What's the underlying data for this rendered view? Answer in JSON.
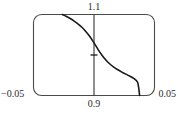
{
  "figure": {
    "background_color": "#ffffff",
    "frame_color": "#4a4a4a",
    "curve_color": "#1a1a1a",
    "text_color": "#2b2b2b"
  },
  "labels": {
    "top": "1.1",
    "bottom": "0.9",
    "left": "−0.05",
    "right": "0.05"
  },
  "chart_data": {
    "type": "line",
    "title": "",
    "xlabel": "",
    "ylabel": "",
    "xlim": [
      -0.05,
      0.05
    ],
    "ylim": [
      0.9,
      1.1
    ],
    "grid": false,
    "legend": null,
    "xtick_labels": [
      "−0.05",
      "0.05"
    ],
    "ytick_labels": [
      "0.9",
      "1.1"
    ],
    "axis_line": {
      "orientation": "vertical",
      "x": 0.0,
      "description": "vertical axis line drawn at x = 0 spanning full frame height"
    },
    "annotations": [
      {
        "kind": "tick",
        "x": 0.0,
        "y": 1.0,
        "description": "short horizontal tick on the vertical axis where the curve crosses"
      }
    ],
    "series": [
      {
        "name": "curve",
        "x": [
          -0.0262,
          -0.0231,
          -0.0197,
          -0.0164,
          -0.0131,
          -0.0098,
          -0.0066,
          -0.0033,
          0.0,
          0.0033,
          0.0066,
          0.0098,
          0.0131,
          0.0164,
          0.0197,
          0.023,
          0.0262,
          0.0295,
          0.0328,
          0.0361,
          0.0377
        ],
        "y": [
          1.1,
          1.0955,
          1.09,
          1.0838,
          1.0765,
          1.0678,
          1.0575,
          1.045,
          1.03,
          1.014,
          0.9995,
          0.9875,
          0.9778,
          0.97,
          0.9635,
          0.9578,
          0.9528,
          0.948,
          0.942,
          0.932,
          0.9
        ]
      }
    ]
  }
}
